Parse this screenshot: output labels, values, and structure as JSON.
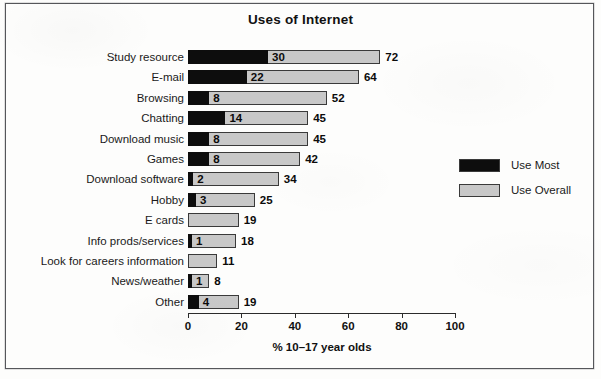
{
  "chart_data": {
    "type": "bar",
    "orientation": "horizontal",
    "title": "Uses of Internet",
    "xlabel": "% 10–17 year olds",
    "ylabel": "",
    "xlim": [
      0,
      100
    ],
    "xticks": [
      0,
      20,
      40,
      60,
      80,
      100
    ],
    "grid": false,
    "legend_position": "right-middle",
    "overlap_style": "overlaid",
    "categories": [
      "Study resource",
      "E-mail",
      "Browsing",
      "Chatting",
      "Download music",
      "Games",
      "Download software",
      "Hobby",
      "E cards",
      "Info prods/services",
      "Look for careers information",
      "News/weather",
      "Other"
    ],
    "series": [
      {
        "name": "Use Most",
        "color": "#0d0d0d",
        "values": [
          30,
          22,
          8,
          14,
          8,
          8,
          2,
          3,
          null,
          1,
          null,
          1,
          4
        ]
      },
      {
        "name": "Use Overall",
        "color": "#c8c8c8",
        "values": [
          72,
          64,
          52,
          45,
          45,
          42,
          34,
          25,
          19,
          18,
          11,
          8,
          19
        ]
      }
    ]
  },
  "legend": {
    "items": [
      {
        "label": "Use Most",
        "color": "#0d0d0d"
      },
      {
        "label": "Use Overall",
        "color": "#c8c8c8"
      }
    ]
  },
  "axis": {
    "tick_labels": [
      "0",
      "20",
      "40",
      "60",
      "80",
      "100"
    ],
    "title": "% 10–17 year olds"
  }
}
